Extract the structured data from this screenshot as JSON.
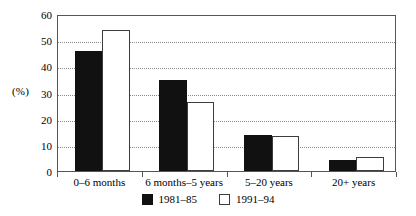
{
  "chart_data": {
    "type": "bar",
    "title": "",
    "subtitle": "",
    "xlabel": "",
    "ylabel": "(%)",
    "ylim": [
      0,
      60
    ],
    "yticks": [
      0,
      10,
      20,
      30,
      40,
      50,
      60
    ],
    "ytick_labels": [
      "0",
      "10",
      "20",
      "30",
      "40",
      "50",
      "60"
    ],
    "grid": "horizontal-dotted",
    "legend_position": "bottom-center",
    "categories": [
      "0–6 months",
      "6 months–5 years",
      "5–20 years",
      "20+ years"
    ],
    "series": [
      {
        "name": "1981–85",
        "color": "#111111",
        "style": "filled-black",
        "values": [
          46,
          34.7,
          13.6,
          4.3
        ]
      },
      {
        "name": "1991–94",
        "color": "#ffffff",
        "style": "outlined-white",
        "values": [
          54,
          26.5,
          13.5,
          5.4
        ]
      }
    ]
  },
  "axis": {
    "unit_label": "(%)"
  },
  "legend": {
    "entries": [
      {
        "label": "1981–85",
        "swatch": "filled-black-square"
      },
      {
        "label": "1991–94",
        "swatch": "outlined-white-square"
      }
    ]
  }
}
